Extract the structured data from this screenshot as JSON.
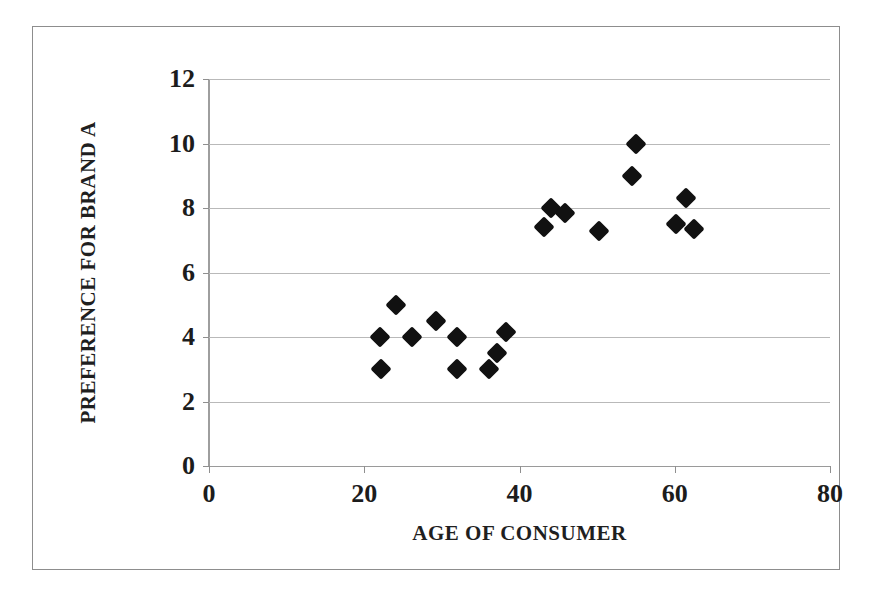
{
  "figure": {
    "kind": "scatter-plot",
    "frame_color": "#8d8d8d",
    "background": "#ffffff",
    "marker_color": "#111111",
    "gridline_color": "#b9b9b9"
  },
  "axes": {
    "x_title": "AGE OF CONSUMER",
    "y_title": "PREFERENCE FOR BRAND A",
    "x_ticks": [
      "0",
      "20",
      "40",
      "60",
      "80"
    ],
    "y_ticks": [
      "0",
      "2",
      "4",
      "6",
      "8",
      "10",
      "12"
    ]
  },
  "chart_data": {
    "type": "scatter",
    "title": "",
    "xlabel": "AGE OF CONSUMER",
    "ylabel": "PREFERENCE FOR BRAND A",
    "xlim": [
      0,
      80
    ],
    "ylim": [
      0,
      12
    ],
    "xticks": [
      0,
      20,
      40,
      60,
      80
    ],
    "yticks": [
      0,
      2,
      4,
      6,
      8,
      10,
      12
    ],
    "grid": "horizontal",
    "legend": "none",
    "series": [
      {
        "name": "Consumers",
        "marker": "diamond",
        "color": "#111111",
        "points": [
          {
            "x": 22.0,
            "y": 4.0
          },
          {
            "x": 22.1,
            "y": 3.0
          },
          {
            "x": 24.1,
            "y": 5.0
          },
          {
            "x": 26.1,
            "y": 4.0
          },
          {
            "x": 29.2,
            "y": 4.5
          },
          {
            "x": 31.9,
            "y": 4.0
          },
          {
            "x": 31.9,
            "y": 3.0
          },
          {
            "x": 36.1,
            "y": 3.0
          },
          {
            "x": 37.1,
            "y": 3.5
          },
          {
            "x": 38.2,
            "y": 4.15
          },
          {
            "x": 43.1,
            "y": 7.4
          },
          {
            "x": 44.1,
            "y": 8.0
          },
          {
            "x": 45.8,
            "y": 7.85
          },
          {
            "x": 50.2,
            "y": 7.3
          },
          {
            "x": 54.5,
            "y": 9.0
          },
          {
            "x": 55.0,
            "y": 10.0
          },
          {
            "x": 60.1,
            "y": 7.5
          },
          {
            "x": 61.4,
            "y": 8.3
          },
          {
            "x": 62.5,
            "y": 7.35
          }
        ]
      }
    ]
  }
}
